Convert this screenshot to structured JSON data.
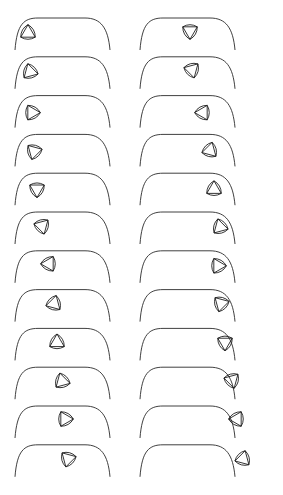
{
  "diagram": {
    "title": "",
    "description_visible": "",
    "colors": {
      "background": "#ffffff",
      "stroke": "#1e1e1e"
    },
    "layout": {
      "columns": 2,
      "rows": 12,
      "row_pitch": 38.8,
      "first_row_top": 14,
      "column_offsets": [
        0,
        125
      ]
    },
    "track": {
      "left_base": [
        15,
        50
      ],
      "left_arc_top": [
        38,
        18
      ],
      "flat_end": [
        85,
        18
      ],
      "right_base": [
        110,
        50
      ]
    },
    "shape": {
      "name": "reuleaux-triangle",
      "radius": 14.5,
      "inner_triangle": true
    },
    "frames": [
      {
        "col": 0,
        "row": 0,
        "cx": 28,
        "cy": 33,
        "rot": 0
      },
      {
        "col": 0,
        "row": 1,
        "cx": 30,
        "cy": 33,
        "rot": -15
      },
      {
        "col": 0,
        "row": 2,
        "cx": 32,
        "cy": 35,
        "rot": -30
      },
      {
        "col": 0,
        "row": 3,
        "cx": 34,
        "cy": 35,
        "rot": -45
      },
      {
        "col": 0,
        "row": 4,
        "cx": 37,
        "cy": 34,
        "rot": -60
      },
      {
        "col": 0,
        "row": 5,
        "cx": 42,
        "cy": 32,
        "rot": -75
      },
      {
        "col": 0,
        "row": 6,
        "cx": 49,
        "cy": 31,
        "rot": -90
      },
      {
        "col": 0,
        "row": 7,
        "cx": 54,
        "cy": 32,
        "rot": -105
      },
      {
        "col": 0,
        "row": 8,
        "cx": 57,
        "cy": 32,
        "rot": -120
      },
      {
        "col": 0,
        "row": 9,
        "cx": 62,
        "cy": 32,
        "rot": -135
      },
      {
        "col": 0,
        "row": 10,
        "cx": 65,
        "cy": 31,
        "rot": -150
      },
      {
        "col": 0,
        "row": 11,
        "cx": 68,
        "cy": 32,
        "rot": -165
      },
      {
        "col": 1,
        "row": 0,
        "cx": 65,
        "cy": 31,
        "rot": 180
      },
      {
        "col": 1,
        "row": 1,
        "cx": 67,
        "cy": 31,
        "rot": 165
      },
      {
        "col": 1,
        "row": 2,
        "cx": 78,
        "cy": 35,
        "rot": 150
      },
      {
        "col": 1,
        "row": 3,
        "cx": 85,
        "cy": 34,
        "rot": 135
      },
      {
        "col": 1,
        "row": 4,
        "cx": 89,
        "cy": 34,
        "rot": 120
      },
      {
        "col": 1,
        "row": 5,
        "cx": 95,
        "cy": 33,
        "rot": 105
      },
      {
        "col": 1,
        "row": 6,
        "cx": 93,
        "cy": 33,
        "rot": 90
      },
      {
        "col": 1,
        "row": 7,
        "cx": 96,
        "cy": 32,
        "rot": 75
      },
      {
        "col": 1,
        "row": 8,
        "cx": 100,
        "cy": 32,
        "rot": 60
      },
      {
        "col": 1,
        "row": 9,
        "cx": 107,
        "cy": 31,
        "rot": 45
      },
      {
        "col": 1,
        "row": 10,
        "cx": 112,
        "cy": 31,
        "rot": 30
      },
      {
        "col": 1,
        "row": 11,
        "cx": 118,
        "cy": 32,
        "rot": 15
      }
    ]
  }
}
